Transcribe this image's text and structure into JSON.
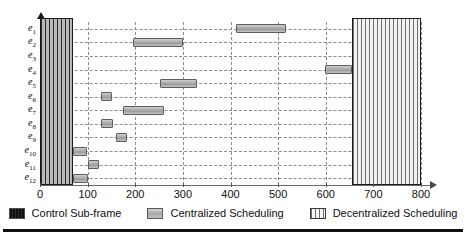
{
  "chart_data": {
    "type": "bar",
    "orientation": "horizontal",
    "title": "",
    "xlabel": "",
    "ylabel": "",
    "xlim": [
      0,
      830
    ],
    "ylim": [
      0,
      12
    ],
    "grid": true,
    "legend_position": "bottom",
    "categories": [
      "e1",
      "e2",
      "e3",
      "e4",
      "e5",
      "e6",
      "e7",
      "e8",
      "e9",
      "e10",
      "e11",
      "e12"
    ],
    "category_labels": [
      {
        "base": "e",
        "sub": "1"
      },
      {
        "base": "e",
        "sub": "2"
      },
      {
        "base": "e",
        "sub": "3"
      },
      {
        "base": "e",
        "sub": "4"
      },
      {
        "base": "e",
        "sub": "5"
      },
      {
        "base": "e",
        "sub": "6"
      },
      {
        "base": "e",
        "sub": "7"
      },
      {
        "base": "e",
        "sub": "8"
      },
      {
        "base": "e",
        "sub": "9"
      },
      {
        "base": "e",
        "sub": "10"
      },
      {
        "base": "e",
        "sub": "11"
      },
      {
        "base": "e",
        "sub": "12"
      }
    ],
    "xticks": [
      0,
      100,
      200,
      300,
      400,
      500,
      600,
      700,
      800
    ],
    "xtick_labels": [
      "0",
      "100",
      "200",
      "300",
      "400",
      "500",
      "600",
      "700",
      "800"
    ],
    "series": [
      {
        "name": "Control Sub-frame",
        "kind": "region",
        "color": "#1a1a1a",
        "pattern": "vertical-stripes",
        "spans": [
          {
            "start": 0,
            "end": 70,
            "rows": [
              1,
              12
            ]
          }
        ]
      },
      {
        "name": "Centralized Scheduling",
        "kind": "bars",
        "color": "#a9a9a9",
        "pattern": "solid-gradient",
        "bars": [
          {
            "row": "e1",
            "start": 412,
            "end": 517
          },
          {
            "row": "e2",
            "start": 196,
            "end": 300
          },
          {
            "row": "e4",
            "start": 598,
            "end": 655
          },
          {
            "row": "e5",
            "start": 253,
            "end": 330
          },
          {
            "row": "e6",
            "start": 128,
            "end": 152
          },
          {
            "row": "e7",
            "start": 175,
            "end": 260
          },
          {
            "row": "e8",
            "start": 128,
            "end": 153
          },
          {
            "row": "e9",
            "start": 159,
            "end": 182
          },
          {
            "row": "e10",
            "start": 70,
            "end": 98
          },
          {
            "row": "e11",
            "start": 100,
            "end": 124
          },
          {
            "row": "e12",
            "start": 70,
            "end": 100
          }
        ]
      },
      {
        "name": "Decentralized Scheduling",
        "kind": "region",
        "color": "#6e6e6e",
        "pattern": "cross-hatch-grid",
        "spans": [
          {
            "start": 655,
            "end": 800,
            "rows": [
              1,
              12
            ]
          }
        ]
      }
    ]
  },
  "legend": {
    "items": [
      {
        "label": "Control Sub-frame",
        "swatch": "control-swatch-icon"
      },
      {
        "label": "Centralized Scheduling",
        "swatch": "centralized-swatch-icon"
      },
      {
        "label": "Decentralized Scheduling",
        "swatch": "decentralized-swatch-icon"
      }
    ]
  },
  "colors": {
    "axis": "#6b6b6b",
    "grid": "#8c8c8c",
    "control": "#1a1a1a",
    "centralized": "#a9a9a9",
    "decentralized": "#6e6e6e",
    "background": "#ffffff",
    "text": "#0f0f0f"
  }
}
